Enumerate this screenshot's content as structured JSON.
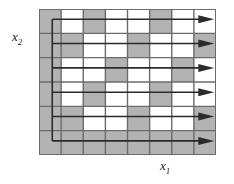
{
  "figure": {
    "type": "raster-scan-diagram",
    "width": 234,
    "height": 184
  },
  "axes": {
    "y_label_base": "x",
    "y_label_sub": "2",
    "x_label_base": "x",
    "x_label_sub": "1"
  },
  "colors": {
    "shaded_cell": "#b3b3b3",
    "blank_cell": "#ffffff",
    "grid_line": "#6b6b6b",
    "border": "#6b6b6b",
    "path_line": "#2b2b2b",
    "background": "#ffffff",
    "text": "#1a1a1a"
  },
  "grid": {
    "columns": 8,
    "rows": 6,
    "cell_states": [
      [
        "shaded",
        "blank",
        "shaded",
        "blank",
        "blank",
        "shaded",
        "blank",
        "blank"
      ],
      [
        "shaded",
        "shaded",
        "blank",
        "blank",
        "shaded",
        "blank",
        "blank",
        "shaded"
      ],
      [
        "shaded",
        "blank",
        "blank",
        "shaded",
        "blank",
        "blank",
        "shaded",
        "blank"
      ],
      [
        "shaded",
        "blank",
        "shaded",
        "blank",
        "blank",
        "shaded",
        "blank",
        "blank"
      ],
      [
        "shaded",
        "shaded",
        "blank",
        "blank",
        "shaded",
        "blank",
        "blank",
        "shaded"
      ],
      [
        "shaded",
        "shaded",
        "shaded",
        "shaded",
        "shaded",
        "shaded",
        "shaded",
        "shaded"
      ]
    ]
  },
  "scan_path": {
    "description": "raster scan lines sweeping left to right",
    "line_count": 6,
    "arrow_direction": "right",
    "return_line_x_fraction": 0.075
  }
}
